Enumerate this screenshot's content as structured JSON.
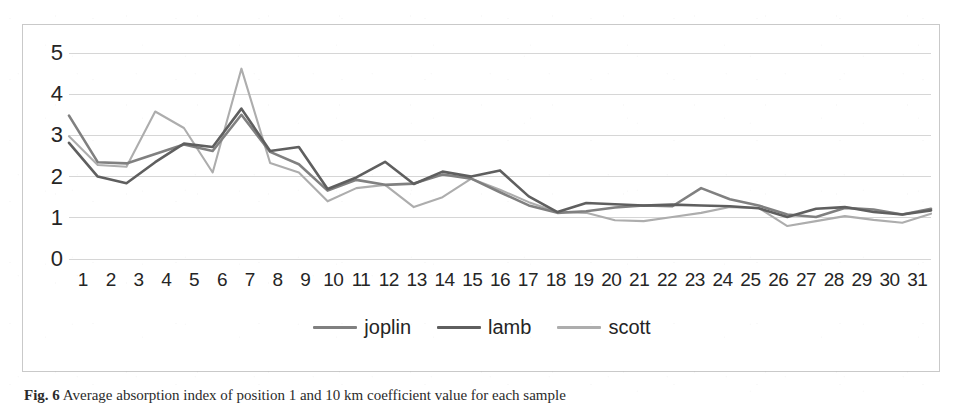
{
  "figure": {
    "caption_label": "Fig. 6",
    "caption_text": "Average absorption index of position 1 and 10 km coefficient value for each sample"
  },
  "chart_data": {
    "type": "line",
    "title": "",
    "xlabel": "",
    "ylabel": "",
    "xlim": [
      1,
      31
    ],
    "ylim": [
      0,
      5
    ],
    "yticks": [
      5,
      4,
      3,
      2,
      1,
      0
    ],
    "grid": true,
    "legend_position": "bottom-center",
    "categories": [
      "1",
      "2",
      "3",
      "4",
      "5",
      "6",
      "7",
      "8",
      "9",
      "10",
      "11",
      "12",
      "13",
      "14",
      "15",
      "16",
      "17",
      "18",
      "19",
      "20",
      "21",
      "22",
      "23",
      "24",
      "25",
      "26",
      "27",
      "28",
      "29",
      "30",
      "31"
    ],
    "series": [
      {
        "name": "joplin",
        "color": "#808080",
        "values": [
          3.48,
          2.35,
          2.32,
          2.55,
          2.78,
          2.62,
          3.5,
          2.6,
          2.3,
          1.66,
          1.92,
          1.8,
          1.83,
          2.05,
          1.95,
          1.62,
          1.3,
          1.12,
          1.16,
          1.25,
          1.3,
          1.28,
          1.72,
          1.45,
          1.3,
          1.08,
          1.02,
          1.24,
          1.2,
          1.08,
          1.22
        ]
      },
      {
        "name": "lamb",
        "color": "#5f5f5f",
        "values": [
          2.82,
          2.0,
          1.84,
          2.35,
          2.8,
          2.72,
          3.65,
          2.62,
          2.72,
          1.7,
          1.98,
          2.36,
          1.82,
          2.12,
          2.0,
          2.15,
          1.52,
          1.14,
          1.36,
          1.33,
          1.3,
          1.32,
          1.3,
          1.28,
          1.23,
          1.02,
          1.22,
          1.26,
          1.14,
          1.08,
          1.18
        ]
      },
      {
        "name": "scott",
        "color": "#adadad",
        "values": [
          2.98,
          2.28,
          2.24,
          3.58,
          3.18,
          2.1,
          4.62,
          2.33,
          2.1,
          1.4,
          1.72,
          1.8,
          1.26,
          1.5,
          1.95,
          1.68,
          1.38,
          1.14,
          1.12,
          0.94,
          0.92,
          1.02,
          1.12,
          1.26,
          1.24,
          0.8,
          0.92,
          1.04,
          0.95,
          0.88,
          1.1
        ]
      }
    ]
  },
  "legend": {
    "items": [
      {
        "label": "joplin"
      },
      {
        "label": "lamb"
      },
      {
        "label": "scott"
      }
    ]
  }
}
